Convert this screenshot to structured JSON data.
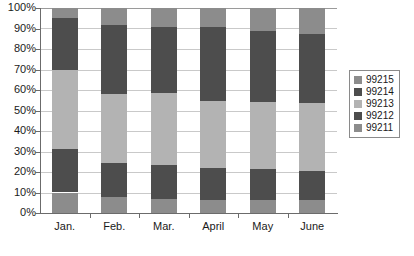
{
  "chart_data": {
    "type": "bar",
    "subtype": "stacked-100-percent",
    "title": "",
    "xlabel": "",
    "ylabel": "",
    "categories": [
      "Jan.",
      "Feb.",
      "Mar.",
      "April",
      "May",
      "June"
    ],
    "ylim": [
      0,
      100
    ],
    "ytick_labels": [
      "100%",
      "90%",
      "80%",
      "70%",
      "60%",
      "50%",
      "40%",
      "30%",
      "20%",
      "10%",
      "0%"
    ],
    "ytick_values": [
      100,
      90,
      80,
      70,
      60,
      50,
      40,
      30,
      20,
      10,
      0
    ],
    "grid": true,
    "legend_position": "right",
    "legend_order_top_to_bottom": [
      "99215",
      "99214",
      "99213",
      "99212",
      "99211"
    ],
    "series": [
      {
        "name": "99211",
        "color": "#8c8c8c",
        "values": [
          10.0,
          8.0,
          7.0,
          6.5,
          6.5,
          6.5
        ]
      },
      {
        "name": "99212",
        "color": "#4d4d4d",
        "values": [
          21.0,
          16.5,
          16.5,
          15.5,
          15.0,
          14.0
        ]
      },
      {
        "name": "99213",
        "color": "#b3b3b3",
        "values": [
          39.0,
          33.5,
          35.0,
          32.5,
          32.5,
          33.0
        ]
      },
      {
        "name": "99214",
        "color": "#4d4d4d",
        "values": [
          25.0,
          33.5,
          32.0,
          36.0,
          35.0,
          34.0
        ]
      },
      {
        "name": "99215",
        "color": "#8c8c8c",
        "values": [
          5.0,
          8.5,
          9.5,
          9.5,
          11.0,
          12.5
        ]
      }
    ],
    "cumulative_tops": {
      "Jan.": [
        10.0,
        31.0,
        70.0,
        95.0,
        100.0
      ],
      "Feb.": [
        8.0,
        24.5,
        58.0,
        91.5,
        100.0
      ],
      "Mar.": [
        7.0,
        23.5,
        58.5,
        90.5,
        100.0
      ],
      "April": [
        6.5,
        22.0,
        54.5,
        90.5,
        100.0
      ],
      "May": [
        6.5,
        21.5,
        54.0,
        89.0,
        100.0
      ],
      "June": [
        6.5,
        20.5,
        53.5,
        87.5,
        100.0
      ]
    }
  },
  "colors": {
    "series_99215": "#8c8c8c",
    "series_99214": "#4d4d4d",
    "series_99213": "#b3b3b3",
    "series_99212": "#4d4d4d",
    "series_99211": "#8c8c8c",
    "gridline": "#c9c9c9",
    "axis": "#6b6b6b",
    "background": "#ffffff",
    "text": "#1a1a1a"
  }
}
